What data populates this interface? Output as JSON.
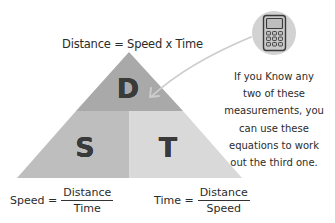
{
  "diagram": {
    "title_formula": "Distance = Speed x Time",
    "triangle": {
      "sections": [
        {
          "id": "top",
          "letter": "D",
          "meaning": "Distance",
          "color": "#a9a9a9"
        },
        {
          "id": "bottom-left",
          "letter": "S",
          "meaning": "Speed",
          "color": "#bebebe"
        },
        {
          "id": "bottom-right",
          "letter": "T",
          "meaning": "Time",
          "color": "#d9d9d9"
        }
      ]
    },
    "note_lines": [
      "If you Know any",
      "two of these",
      "measurements, you",
      "can use these",
      "equations to work",
      "out the third one."
    ],
    "icon": "calculator-icon",
    "equations": {
      "speed": {
        "lhs": "Speed =",
        "numerator": "Distance",
        "denominator": "Time"
      },
      "time": {
        "lhs": "Time =",
        "numerator": "Distance",
        "denominator": "Speed"
      }
    },
    "colors": {
      "icon_circle": "#d2d2d2",
      "arrow": "#cdcdcd",
      "text": "#2b2b2b"
    }
  }
}
